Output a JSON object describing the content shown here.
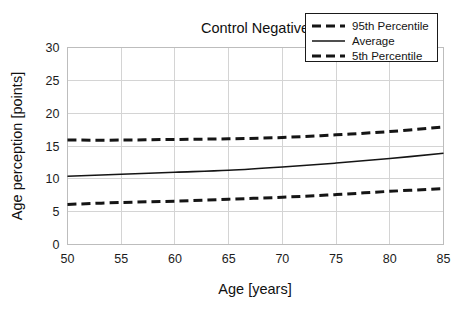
{
  "chart_data": {
    "type": "line",
    "title": "Control Negative",
    "xlabel": "Age [years]",
    "ylabel": "Age perception [points]",
    "xlim": [
      50,
      85
    ],
    "ylim": [
      0,
      30
    ],
    "xticks": [
      50,
      55,
      60,
      65,
      70,
      75,
      80,
      85
    ],
    "yticks": [
      0,
      5,
      10,
      15,
      20,
      25,
      30
    ],
    "grid": true,
    "legend_position": "top-right",
    "x": [
      50,
      55,
      60,
      65,
      70,
      75,
      80,
      85
    ],
    "series": [
      {
        "name": "95th Percentile",
        "style": "dashed",
        "width": 3.0,
        "color": "#151515",
        "values": [
          15.9,
          15.9,
          16.0,
          16.1,
          16.3,
          16.7,
          17.2,
          17.9
        ]
      },
      {
        "name": "Average",
        "style": "solid",
        "width": 1.6,
        "color": "#151515",
        "values": [
          10.4,
          10.7,
          11.0,
          11.3,
          11.8,
          12.4,
          13.1,
          13.9
        ]
      },
      {
        "name": "5th Percentile",
        "style": "dashed",
        "width": 3.0,
        "color": "#151515",
        "values": [
          6.1,
          6.4,
          6.6,
          6.9,
          7.2,
          7.6,
          8.1,
          8.5
        ]
      }
    ]
  },
  "legend": {
    "entries": [
      {
        "label": "95th Percentile",
        "style": "dashed"
      },
      {
        "label": "Average",
        "style": "solid"
      },
      {
        "label": "5th Percentile",
        "style": "dashed"
      }
    ]
  },
  "axes": {
    "x_tick_labels": [
      "50",
      "55",
      "60",
      "65",
      "70",
      "75",
      "80",
      "85"
    ],
    "y_tick_labels": [
      "0",
      "5",
      "10",
      "15",
      "20",
      "25",
      "30"
    ]
  },
  "colors": {
    "background": "#ffffff",
    "line": "#151515",
    "grid": "#d4d4d4",
    "border": "#bdbdbd",
    "text": "#1a1a1a"
  }
}
